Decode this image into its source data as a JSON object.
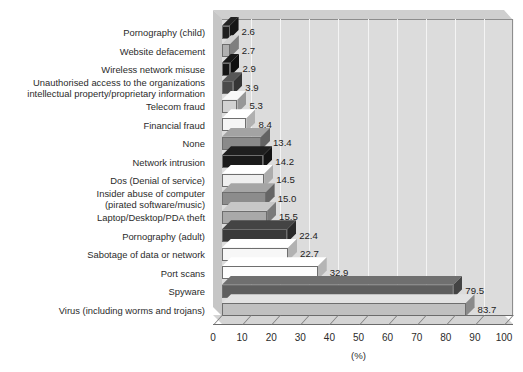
{
  "chart_data": {
    "type": "bar",
    "orientation": "horizontal",
    "title": "",
    "xlabel": "(%)",
    "ylabel": "",
    "xlim": [
      0,
      100
    ],
    "xticks": [
      0,
      10,
      20,
      30,
      40,
      50,
      60,
      70,
      80,
      90,
      100
    ],
    "grid": true,
    "legend": false,
    "style": "3d-bar",
    "categories": [
      "Pornography (child)",
      "Website defacement",
      "Wireless network misuse",
      "Unauthorised access to the organizations\nintellectual property/proprietary information",
      "Telecom fraud",
      "Financial fraud",
      "None",
      "Network intrusion",
      "Dos (Denial of service)",
      "Insider abuse of computer\n(pirated software/music)",
      "Laptop/Desktop/PDA theft",
      "Pornography (adult)",
      "Sabotage of data or network",
      "Port scans",
      "Spyware",
      "Virus (including worms and trojans)"
    ],
    "values": [
      2.6,
      2.7,
      2.9,
      3.9,
      5.3,
      8.4,
      13.4,
      14.2,
      14.5,
      15.0,
      15.5,
      22.4,
      22.7,
      32.9,
      79.5,
      83.7
    ],
    "value_labels": [
      "2.6",
      "2.7",
      "2.9",
      "3.9",
      "5.3",
      "8.4",
      "13.4",
      "14.2",
      "14.5",
      "15.0",
      "15.5",
      "22.4",
      "22.7",
      "32.9",
      "79.5",
      "83.7"
    ],
    "bar_colors": [
      "#1e1e1e",
      "#b0b0b0",
      "#151515",
      "#4a4a4a",
      "#d2d2d2",
      "#f5f5f5",
      "#8a8a8a",
      "#1a1a1a",
      "#efefef",
      "#8c8c8c",
      "#a9a9a9",
      "#3a3a3a",
      "#f7f7f7",
      "#fcfcfc",
      "#5e5e5e",
      "#c0c0c0"
    ],
    "plot_background": "#dcdcdc",
    "gridline_color": "#f4f4f4",
    "page_background": "#ffffff"
  }
}
